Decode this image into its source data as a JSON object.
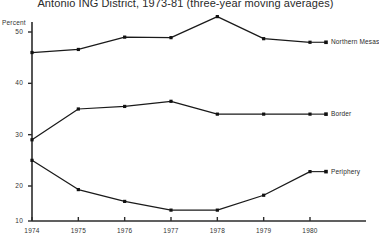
{
  "chart_data": {
    "type": "line",
    "title": "Antonio ING District, 1973-81 (three-year moving averages)",
    "xlabel": "",
    "ylabel": "Percent",
    "x": [
      1974,
      1975,
      1976,
      1977,
      1978,
      1979,
      1980
    ],
    "xtick_labels": [
      "1974",
      "1975",
      "1976",
      "1977",
      "1978",
      "1979",
      "1980"
    ],
    "ytick_labels": [
      "50",
      "40",
      "30",
      "20",
      "10"
    ],
    "ytick_values": [
      50,
      40,
      30,
      20,
      10
    ],
    "ylim": [
      10,
      53
    ],
    "xlim": [
      1974,
      1980
    ],
    "grid": false,
    "legend_position": "right-inline",
    "series": [
      {
        "name": "Northern Mesas",
        "values": [
          46,
          46.6,
          49,
          48.9,
          53,
          48.7,
          48
        ]
      },
      {
        "name": "Border",
        "values": [
          29,
          35,
          35.5,
          36.5,
          34,
          34,
          34
        ]
      },
      {
        "name": "Periphery",
        "values": [
          25,
          19.3,
          17,
          15.3,
          15.3,
          18.2,
          22.8
        ]
      }
    ]
  },
  "axis": {
    "y_title": "Percent"
  }
}
